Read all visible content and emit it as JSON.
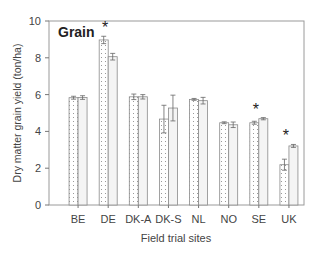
{
  "chart_data": {
    "type": "bar",
    "title": "Grain",
    "xlabel": "Field trial sites",
    "ylabel": "Dry matter grain yield (ton/ha)",
    "ylim": [
      0,
      10
    ],
    "yticks": [
      0,
      2,
      4,
      6,
      8,
      10
    ],
    "grid": false,
    "legend": null,
    "categories": [
      "BE",
      "DE",
      "DK-A",
      "DK-S",
      "NL",
      "NO",
      "SE",
      "UK"
    ],
    "series": [
      {
        "name": "Series 1 (dotted)",
        "pattern": "dotted",
        "values": [
          5.83,
          8.97,
          5.88,
          4.67,
          5.74,
          4.47,
          4.47,
          2.19
        ],
        "errors": [
          0.08,
          0.2,
          0.15,
          0.75,
          0.05,
          0.05,
          0.08,
          0.3
        ]
      },
      {
        "name": "Series 2 (light)",
        "pattern": "light",
        "values": [
          5.84,
          8.06,
          5.88,
          5.27,
          5.67,
          4.36,
          4.69,
          3.21
        ],
        "errors": [
          0.1,
          0.18,
          0.12,
          0.7,
          0.18,
          0.15,
          0.06,
          0.08
        ]
      }
    ],
    "annotations": [
      {
        "category": "DE",
        "text": "*"
      },
      {
        "category": "SE",
        "text": "*"
      },
      {
        "category": "UK",
        "text": "*"
      }
    ]
  }
}
